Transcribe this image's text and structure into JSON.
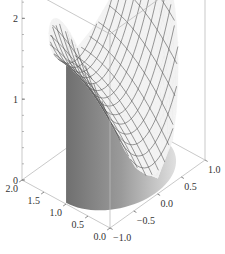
{
  "chart_data": {
    "type": "surface3d",
    "title": "",
    "axes": {
      "x": {
        "label": "",
        "range": [
          0.0,
          2.0
        ],
        "ticks": [
          "0.0",
          "0.5",
          "1.0",
          "1.5",
          "2.0"
        ]
      },
      "y": {
        "label": "",
        "range": [
          -1.0,
          1.0
        ],
        "ticks": [
          "-1.0",
          "-0.5",
          "0.0",
          "0.5",
          "1.0"
        ]
      },
      "z": {
        "label": "",
        "range": [
          0,
          2.4
        ],
        "ticks": [
          "0",
          "1",
          "2"
        ]
      }
    },
    "box": true,
    "mesh": true,
    "mesh_lines": 15,
    "filling": "bottom",
    "colors": {
      "surface": "#f2f2f2",
      "mesh": "#555555",
      "filling": "#8a8a8a",
      "box": "#bbbbbb"
    }
  }
}
